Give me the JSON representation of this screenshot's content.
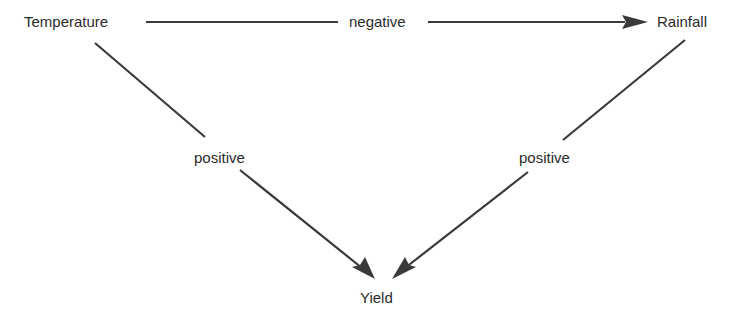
{
  "diagram": {
    "nodes": {
      "temperature": "Temperature",
      "rainfall": "Rainfall",
      "yield": "Yield"
    },
    "edges": [
      {
        "from": "Temperature",
        "to": "Rainfall",
        "label": "negative"
      },
      {
        "from": "Temperature",
        "to": "Yield",
        "label": "positive"
      },
      {
        "from": "Rainfall",
        "to": "Yield",
        "label": "positive"
      }
    ],
    "colors": {
      "line": "#3a3a3a",
      "text": "#2b2b2b"
    }
  }
}
